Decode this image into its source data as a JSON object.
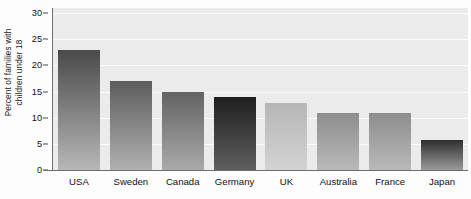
{
  "chart_data": {
    "type": "bar",
    "title": "",
    "xlabel": "",
    "ylabel": "Percent of families with children under 18",
    "ylabel_lines": [
      "Percent of families with",
      "children under 18"
    ],
    "categories": [
      "USA",
      "Sweden",
      "Canada",
      "Germany",
      "UK",
      "Australia",
      "France",
      "Japan"
    ],
    "values": [
      23,
      17,
      15,
      14,
      12.8,
      11,
      11,
      5.7
    ],
    "ylim": [
      0,
      31
    ],
    "yticks": [
      0,
      5,
      10,
      15,
      20,
      25,
      30
    ],
    "ytick_labels": [
      "0",
      "5",
      "10",
      "15",
      "20",
      "25",
      "30"
    ],
    "grid": true,
    "grid_axis": "y",
    "legend": "none",
    "orientation": "vertical",
    "bar_colors_top": [
      "#4a4a4a",
      "#5c5c5c",
      "#636363",
      "#1f1f1f",
      "#b6b6b6",
      "#8d8d8d",
      "#8d8d8d",
      "#2e2e2e"
    ],
    "bar_colors_bottom": [
      "#b7b7b7",
      "#b0b0b0",
      "#a9a9a9",
      "#5f5f5f",
      "#d3d3d3",
      "#b9b9b9",
      "#b9b9b9",
      "#9a9a9a"
    ],
    "plot_background": "#ebebeb",
    "gridline_color": "#fbfbfb",
    "axis_color": "#6e6e6e"
  }
}
